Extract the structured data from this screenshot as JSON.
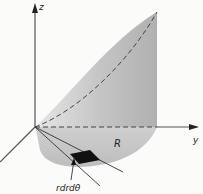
{
  "diagram": {
    "type": "3d-volume-polar-integration",
    "axes": {
      "z_label": "z",
      "y_label": "y",
      "x_label": ""
    },
    "region_label": "R",
    "element_label": "rdrdθ",
    "colors": {
      "surface_fill": "#bdbdbd",
      "surface_light": "#e2e2e2",
      "axis": "#555555",
      "element_fill": "#111111",
      "background": "#fbfbfa"
    }
  }
}
